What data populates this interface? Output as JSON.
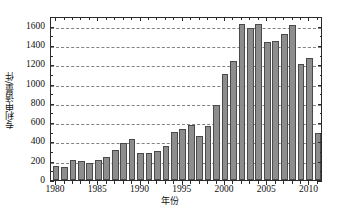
{
  "chart_data": {
    "type": "bar",
    "title": "",
    "xlabel": "年份",
    "ylabel": "专利申请量/件",
    "ylim": [
      0,
      1700
    ],
    "xlim": [
      1979.4,
      2011.6
    ],
    "grid": "horizontal-dashed",
    "legend": "none",
    "y_ticks": [
      0,
      200,
      400,
      600,
      800,
      1000,
      1200,
      1400,
      1600
    ],
    "y_tick_labels": [
      "0",
      "200",
      "400",
      "600",
      "800",
      "1000",
      "1200",
      "1400",
      "1600"
    ],
    "x_ticks": [
      1980,
      1985,
      1990,
      1995,
      2000,
      2005,
      2010
    ],
    "x_tick_labels": [
      "1980",
      "1985",
      "1990",
      "1995",
      "2000",
      "2005",
      "2010"
    ],
    "categories": [
      "1980",
      "1981",
      "1982",
      "1983",
      "1984",
      "1985",
      "1986",
      "1987",
      "1988",
      "1989",
      "1990",
      "1991",
      "1992",
      "1993",
      "1994",
      "1995",
      "1996",
      "1997",
      "1998",
      "1999",
      "2000",
      "2001",
      "2002",
      "2003",
      "2004",
      "2005",
      "2006",
      "2007",
      "2008",
      "2009",
      "2010",
      "2011"
    ],
    "values": [
      150,
      140,
      210,
      200,
      175,
      210,
      235,
      315,
      380,
      430,
      280,
      275,
      305,
      350,
      500,
      530,
      570,
      460,
      565,
      775,
      1100,
      1230,
      1620,
      1575,
      1620,
      1430,
      1445,
      1510,
      1610,
      1205,
      1265,
      485
    ],
    "bar_color": "#8d8d8d",
    "bar_edge_color": "#4a4a4a",
    "axis_color": "#2a2a2a",
    "grid_color": "#6e6e6e"
  },
  "figure": {
    "caption": ""
  }
}
